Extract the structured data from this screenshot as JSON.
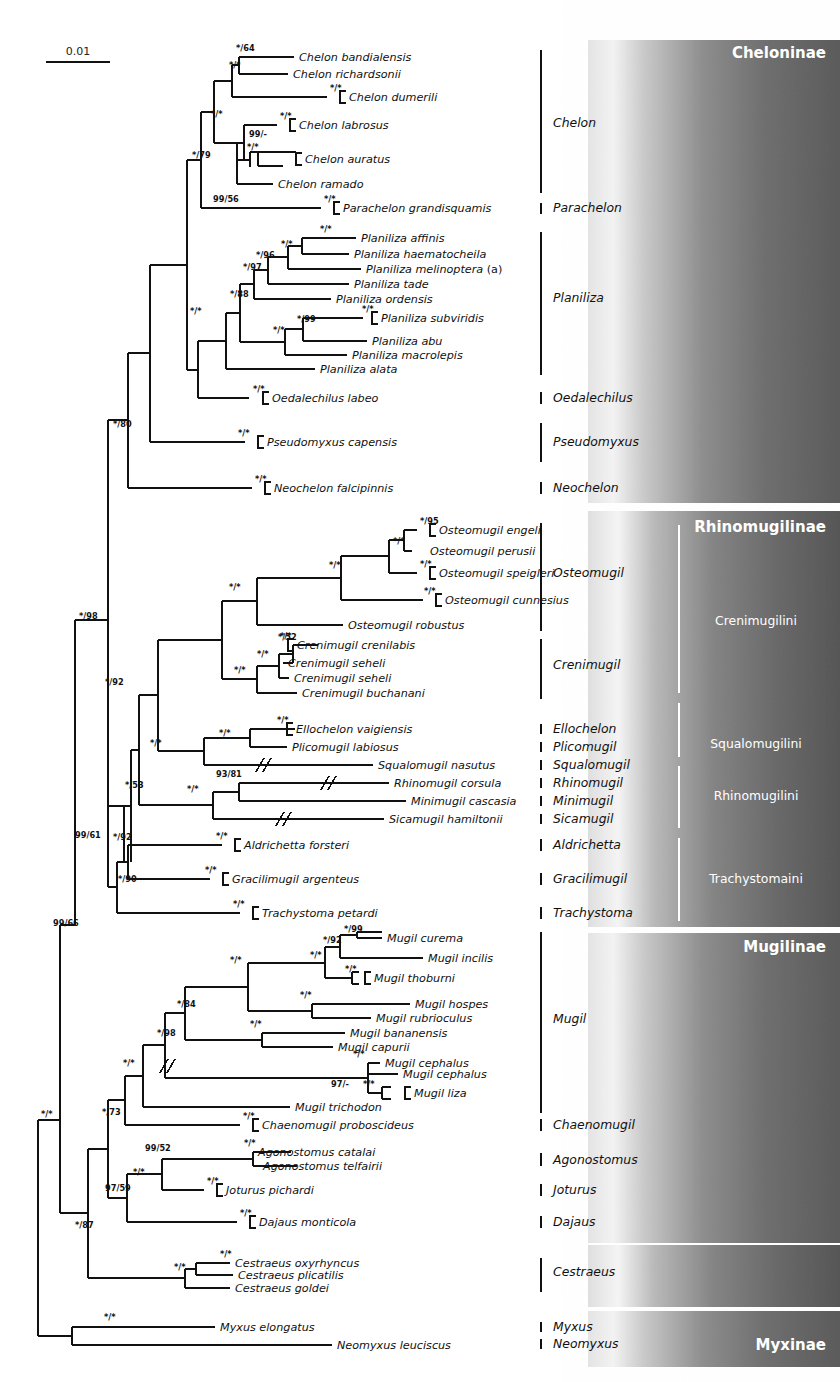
{
  "scale_bar": {
    "label": "0.01"
  },
  "panels": [
    {
      "id": "cheloninae",
      "subfamily": "Cheloninae",
      "tribes": []
    },
    {
      "id": "rhinomugilinae",
      "subfamily": "Rhinomugilinae",
      "tribes": [
        "Crenimugilini",
        "Squalomugilini",
        "Rhinomugilini",
        "Trachystomaini"
      ]
    },
    {
      "id": "mugilinae",
      "subfamily": "Mugilinae",
      "tribes": []
    },
    {
      "id": "myxinae",
      "subfamily": "Myxinae",
      "tribes": []
    }
  ],
  "genera": [
    {
      "name": "Chelon",
      "y": 123
    },
    {
      "name": "Parachelon",
      "y": 208
    },
    {
      "name": "Planiliza",
      "y": 298
    },
    {
      "name": "Oedalechilus",
      "y": 398
    },
    {
      "name": "Pseudomyxus",
      "y": 442
    },
    {
      "name": "Neochelon",
      "y": 488
    },
    {
      "name": "Osteomugil",
      "y": 573
    },
    {
      "name": "Crenimugil",
      "y": 665
    },
    {
      "name": "Ellochelon",
      "y": 729
    },
    {
      "name": "Plicomugil",
      "y": 747
    },
    {
      "name": "Squalomugil",
      "y": 765
    },
    {
      "name": "Rhinomugil",
      "y": 783
    },
    {
      "name": "Minimugil",
      "y": 801
    },
    {
      "name": "Sicamugil",
      "y": 819
    },
    {
      "name": "Aldrichetta",
      "y": 845
    },
    {
      "name": "Gracilimugil",
      "y": 879
    },
    {
      "name": "Trachystoma",
      "y": 913
    },
    {
      "name": "Mugil",
      "y": 1019
    },
    {
      "name": "Chaenomugil",
      "y": 1125
    },
    {
      "name": "Agonostomus",
      "y": 1160
    },
    {
      "name": "Joturus",
      "y": 1190
    },
    {
      "name": "Dajaus",
      "y": 1222
    },
    {
      "name": "Cestraeus",
      "y": 1272
    },
    {
      "name": "Myxus",
      "y": 1327
    },
    {
      "name": "Neomyxus",
      "y": 1344
    }
  ],
  "chart_data": {
    "type": "tree",
    "scale_bar_value": "0.01",
    "support_format": "posterior probability / bootstrap ( * = maximal support, - = not recovered )",
    "taxa": [
      {
        "name": "Chelon bandialensis",
        "y": 57,
        "tip_x": 294,
        "support": "*/64"
      },
      {
        "name": "Chelon richardsonii",
        "y": 74,
        "tip_x": 288,
        "support": "*/*"
      },
      {
        "name": "Chelon dumerili",
        "y": 97,
        "tip_x": 340,
        "support": "*/*",
        "bracket": true
      },
      {
        "name": "Chelon labrosus",
        "y": 125,
        "tip_x": 290,
        "support": "*/*",
        "bracket": true
      },
      {
        "name": "Chelon auratus",
        "y": 159,
        "tip_x": 296,
        "support": "*/*",
        "bracket": true
      },
      {
        "name": "Chelon ramado",
        "y": 184,
        "tip_x": 273,
        "support": ""
      },
      {
        "name": "Parachelon grandisquamis",
        "y": 208,
        "tip_x": 334,
        "support": "*/*",
        "bracket": true
      },
      {
        "name": "Planiliza affinis",
        "y": 238,
        "tip_x": 356,
        "support": "*/*"
      },
      {
        "name": "Planiliza haematocheila",
        "y": 254,
        "tip_x": 349,
        "support": ""
      },
      {
        "name": "Planiliza melinoptera (a)",
        "y": 269,
        "tip_x": 361,
        "support": ""
      },
      {
        "name": "Planiliza tade",
        "y": 284,
        "tip_x": 349,
        "support": ""
      },
      {
        "name": "Planiliza ordensis",
        "y": 299,
        "tip_x": 331,
        "support": ""
      },
      {
        "name": "Planiliza subviridis",
        "y": 318,
        "tip_x": 372,
        "support": "*/*",
        "bracket": true
      },
      {
        "name": "Planiliza abu",
        "y": 341,
        "tip_x": 367,
        "support": ""
      },
      {
        "name": "Planiliza macrolepis",
        "y": 355,
        "tip_x": 347,
        "support": ""
      },
      {
        "name": "Planiliza alata",
        "y": 369,
        "tip_x": 315,
        "support": ""
      },
      {
        "name": "Oedalechilus labeo",
        "y": 398,
        "tip_x": 263,
        "support": "*/*",
        "bracket": true
      },
      {
        "name": "Pseudomyxus capensis",
        "y": 442,
        "tip_x": 258,
        "support": "*/*",
        "bracket": true
      },
      {
        "name": "Neochelon falcipinnis",
        "y": 488,
        "tip_x": 265,
        "support": "*/*",
        "bracket": true
      },
      {
        "name": "Osteomugil engeli",
        "y": 530,
        "tip_x": 430,
        "support": "*/95",
        "bracket": true
      },
      {
        "name": "Osteomugil perusii",
        "y": 551,
        "tip_x": 425,
        "support": "*/*"
      },
      {
        "name": "Osteomugil speigleri",
        "y": 573,
        "tip_x": 430,
        "support": "*/*",
        "bracket": true
      },
      {
        "name": "Osteomugil cunnesius",
        "y": 600,
        "tip_x": 436,
        "support": "*/*",
        "bracket": true
      },
      {
        "name": "Osteomugil robustus",
        "y": 625,
        "tip_x": 343,
        "support": ""
      },
      {
        "name": "Crenimugil crenilabis",
        "y": 645,
        "tip_x": 288,
        "support": "*/*",
        "bracket": true
      },
      {
        "name": "Crenimugil seheli",
        "y": 663,
        "tip_x": 283,
        "support": ""
      },
      {
        "name": "Crenimugil seheli",
        "y": 678,
        "tip_x": 289,
        "support": ""
      },
      {
        "name": "Crenimugil buchanani",
        "y": 693,
        "tip_x": 297,
        "support": ""
      },
      {
        "name": "Ellochelon vaigiensis",
        "y": 729,
        "tip_x": 287,
        "support": "*/*",
        "bracket": true
      },
      {
        "name": "Plicomugil labiosus",
        "y": 747,
        "tip_x": 287,
        "support": ""
      },
      {
        "name": "Squalomugil nasutus",
        "y": 765,
        "tip_x": 373,
        "support": "",
        "slash": 260
      },
      {
        "name": "Rhinomugil corsula",
        "y": 783,
        "tip_x": 389,
        "support": "93/81",
        "slash": 325
      },
      {
        "name": "Minimugil cascasia",
        "y": 801,
        "tip_x": 406,
        "support": ""
      },
      {
        "name": "Sicamugil hamiltonii",
        "y": 819,
        "tip_x": 384,
        "support": "",
        "slash": 280
      },
      {
        "name": "Aldrichetta forsteri",
        "y": 845,
        "tip_x": 235,
        "support": "*/*",
        "bracket": true
      },
      {
        "name": "Gracilimugil argenteus",
        "y": 879,
        "tip_x": 223,
        "support": "*/*",
        "bracket": true
      },
      {
        "name": "Trachystoma petardi",
        "y": 913,
        "tip_x": 253,
        "support": "*/*",
        "bracket": true
      },
      {
        "name": "Mugil curema",
        "y": 938,
        "tip_x": 382,
        "support": "*/99"
      },
      {
        "name": "Mugil incilis",
        "y": 958,
        "tip_x": 423,
        "support": ""
      },
      {
        "name": "Mugil thoburni",
        "y": 978,
        "tip_x": 365,
        "support": "*/*",
        "bracket": true
      },
      {
        "name": "Mugil hospes",
        "y": 1004,
        "tip_x": 410,
        "support": "*/*"
      },
      {
        "name": "Mugil rubrioculus",
        "y": 1018,
        "tip_x": 371,
        "support": ""
      },
      {
        "name": "Mugil bananensis",
        "y": 1033,
        "tip_x": 345,
        "support": ""
      },
      {
        "name": "Mugil capurii",
        "y": 1047,
        "tip_x": 333,
        "support": ""
      },
      {
        "name": "Mugil cephalus",
        "y": 1063,
        "tip_x": 380,
        "support": ""
      },
      {
        "name": "Mugil cephalus",
        "y": 1074,
        "tip_x": 398,
        "support": "*/*"
      },
      {
        "name": "Mugil liza",
        "y": 1093,
        "tip_x": 405,
        "support": "*/*",
        "bracket": true
      },
      {
        "name": "Mugil trichodon",
        "y": 1107,
        "tip_x": 290,
        "support": ""
      },
      {
        "name": "Chaenomugil proboscideus",
        "y": 1125,
        "tip_x": 253,
        "support": "*/*",
        "bracket": true
      },
      {
        "name": "Agonostomus catalai",
        "y": 1152,
        "tip_x": 253,
        "support": "*/*"
      },
      {
        "name": "Agonostomus telfairii",
        "y": 1166,
        "tip_x": 258,
        "support": ""
      },
      {
        "name": "Joturus pichardi",
        "y": 1190,
        "tip_x": 217,
        "support": "*/*",
        "bracket": true
      },
      {
        "name": "Dajaus monticola",
        "y": 1222,
        "tip_x": 250,
        "support": "*/*",
        "bracket": true
      },
      {
        "name": "Cestraeus oxyrhyncus",
        "y": 1263,
        "tip_x": 230,
        "support": "*/*"
      },
      {
        "name": "Cestraeus plicatilis",
        "y": 1275,
        "tip_x": 233,
        "support": ""
      },
      {
        "name": "Cestraeus goldei",
        "y": 1288,
        "tip_x": 230,
        "support": ""
      },
      {
        "name": "Myxus elongatus",
        "y": 1327,
        "tip_x": 215,
        "support": "*/*"
      },
      {
        "name": "Neomyxus leuciscus",
        "y": 1345,
        "tip_x": 332,
        "support": ""
      }
    ],
    "internal_supports": [
      {
        "label": "*/64",
        "x": 236,
        "y": 51
      },
      {
        "label": "*/*",
        "x": 229,
        "y": 68
      },
      {
        "label": "*/*",
        "x": 330,
        "y": 91
      },
      {
        "label": "*/*",
        "x": 280,
        "y": 119
      },
      {
        "label": "99/-",
        "x": 249,
        "y": 137
      },
      {
        "label": "*/*",
        "x": 247,
        "y": 150
      },
      {
        "label": "*/*",
        "x": 211,
        "y": 117
      },
      {
        "label": "*/79",
        "x": 192,
        "y": 158
      },
      {
        "label": "99/56",
        "x": 213,
        "y": 202
      },
      {
        "label": "*/*",
        "x": 324,
        "y": 202
      },
      {
        "label": "*/*",
        "x": 320,
        "y": 232
      },
      {
        "label": "*/*",
        "x": 281,
        "y": 247
      },
      {
        "label": "*/96",
        "x": 256,
        "y": 258
      },
      {
        "label": "*/97",
        "x": 243,
        "y": 270
      },
      {
        "label": "*/88",
        "x": 230,
        "y": 297
      },
      {
        "label": "*/*",
        "x": 362,
        "y": 312
      },
      {
        "label": "*/99",
        "x": 297,
        "y": 322
      },
      {
        "label": "*/*",
        "x": 273,
        "y": 333
      },
      {
        "label": "*/*",
        "x": 190,
        "y": 314
      },
      {
        "label": "*/*",
        "x": 253,
        "y": 392
      },
      {
        "label": "*/*",
        "x": 238,
        "y": 436
      },
      {
        "label": "*/*",
        "x": 255,
        "y": 482
      },
      {
        "label": "*/80",
        "x": 113,
        "y": 427
      },
      {
        "label": "*/98",
        "x": 79,
        "y": 619
      },
      {
        "label": "*/95",
        "x": 420,
        "y": 524
      },
      {
        "label": "*/*",
        "x": 393,
        "y": 544
      },
      {
        "label": "*/*",
        "x": 420,
        "y": 567
      },
      {
        "label": "*/*",
        "x": 424,
        "y": 594
      },
      {
        "label": "*/*",
        "x": 329,
        "y": 568
      },
      {
        "label": "*/*",
        "x": 229,
        "y": 590
      },
      {
        "label": "*/52",
        "x": 278,
        "y": 640
      },
      {
        "label": "*/*",
        "x": 280,
        "y": 639
      },
      {
        "label": "*/*",
        "x": 257,
        "y": 657
      },
      {
        "label": "*/*",
        "x": 234,
        "y": 673
      },
      {
        "label": "*/92",
        "x": 105,
        "y": 685
      },
      {
        "label": "*/*",
        "x": 277,
        "y": 723
      },
      {
        "label": "*/*",
        "x": 219,
        "y": 736
      },
      {
        "label": "*/*",
        "x": 150,
        "y": 746
      },
      {
        "label": "93/81",
        "x": 216,
        "y": 777
      },
      {
        "label": "*/*",
        "x": 187,
        "y": 792
      },
      {
        "label": "*/53",
        "x": 125,
        "y": 788
      },
      {
        "label": "99/61",
        "x": 75,
        "y": 838
      },
      {
        "label": "*/92",
        "x": 113,
        "y": 840
      },
      {
        "label": "*/*",
        "x": 216,
        "y": 839
      },
      {
        "label": "*/*",
        "x": 205,
        "y": 873
      },
      {
        "label": "*/90",
        "x": 118,
        "y": 882
      },
      {
        "label": "*/*",
        "x": 233,
        "y": 907
      },
      {
        "label": "99/66",
        "x": 53,
        "y": 926
      },
      {
        "label": "*/99",
        "x": 344,
        "y": 932
      },
      {
        "label": "*/92",
        "x": 323,
        "y": 943
      },
      {
        "label": "*/*",
        "x": 310,
        "y": 958
      },
      {
        "label": "*/*",
        "x": 345,
        "y": 972
      },
      {
        "label": "*/*",
        "x": 230,
        "y": 963
      },
      {
        "label": "*/*",
        "x": 300,
        "y": 998
      },
      {
        "label": "*/84",
        "x": 177,
        "y": 1007
      },
      {
        "label": "*/*",
        "x": 250,
        "y": 1027
      },
      {
        "label": "*/98",
        "x": 157,
        "y": 1036
      },
      {
        "label": "*/*",
        "x": 353,
        "y": 1057
      },
      {
        "label": "97/-",
        "x": 331,
        "y": 1087
      },
      {
        "label": "*/*",
        "x": 363,
        "y": 1087
      },
      {
        "label": "*/*",
        "x": 123,
        "y": 1066
      },
      {
        "label": "*/73",
        "x": 102,
        "y": 1115
      },
      {
        "label": "*/*",
        "x": 243,
        "y": 1119
      },
      {
        "label": "*/*",
        "x": 244,
        "y": 1146
      },
      {
        "label": "99/52",
        "x": 145,
        "y": 1151
      },
      {
        "label": "*/*",
        "x": 207,
        "y": 1184
      },
      {
        "label": "*/*",
        "x": 133,
        "y": 1175
      },
      {
        "label": "97/59",
        "x": 105,
        "y": 1191
      },
      {
        "label": "*/*",
        "x": 240,
        "y": 1216
      },
      {
        "label": "*/87",
        "x": 75,
        "y": 1228
      },
      {
        "label": "*/*",
        "x": 220,
        "y": 1257
      },
      {
        "label": "*/*",
        "x": 174,
        "y": 1270
      },
      {
        "label": "*/*",
        "x": 41,
        "y": 1117
      },
      {
        "label": "*/*",
        "x": 104,
        "y": 1320
      }
    ]
  }
}
